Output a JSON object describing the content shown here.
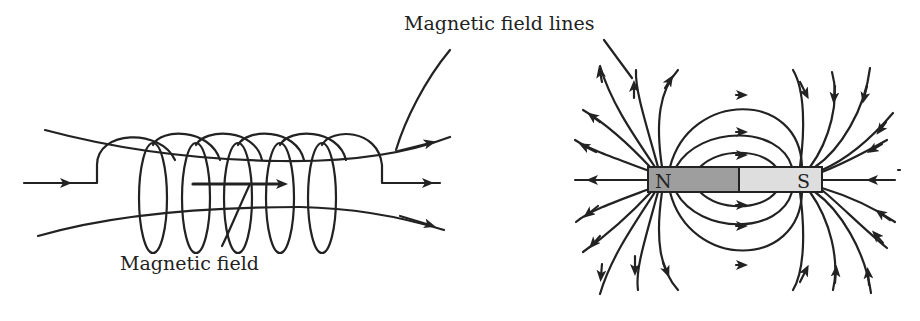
{
  "diagram": {
    "labels": {
      "field_lines": "Magnetic field lines",
      "field": "Magnetic field",
      "north_pole": "N",
      "south_pole": "S"
    },
    "colors": {
      "stroke": "#222222",
      "north_fill": "#9e9e9e",
      "south_fill": "#dedede",
      "background": "#ffffff"
    },
    "solenoid": {
      "turns": 6
    },
    "bar_magnet": {
      "poles": [
        "N",
        "S"
      ]
    }
  }
}
